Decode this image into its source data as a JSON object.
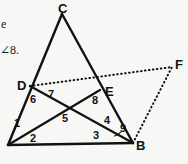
{
  "figure": {
    "type": "geometry-diagram",
    "width": 188,
    "height": 164,
    "background_color": "#f7f7f5",
    "stroke_color": "#111111",
    "caption_fragment_left": "e",
    "caption_fragment_angle": "∠8.",
    "vertices": [
      {
        "id": "A",
        "label": "",
        "x": 8,
        "y": 145
      },
      {
        "id": "B",
        "label": "B",
        "x": 133,
        "y": 143
      },
      {
        "id": "C",
        "label": "C",
        "x": 62,
        "y": 14
      },
      {
        "id": "D",
        "label": "D",
        "x": 30,
        "y": 86
      },
      {
        "id": "E",
        "label": "E",
        "x": 100,
        "y": 90
      },
      {
        "id": "F",
        "label": "F",
        "x": 172,
        "y": 67
      }
    ],
    "vertex_labels": [
      {
        "name": "vertex-label-c",
        "text": "C",
        "x": 58,
        "y": 2
      },
      {
        "name": "vertex-label-d",
        "text": "D",
        "x": 17,
        "y": 79
      },
      {
        "name": "vertex-label-e",
        "text": "E",
        "x": 105,
        "y": 85
      },
      {
        "name": "vertex-label-f",
        "text": "F",
        "x": 175,
        "y": 58
      },
      {
        "name": "vertex-label-b",
        "text": "B",
        "x": 136,
        "y": 139
      }
    ],
    "angle_labels": [
      {
        "name": "angle-label-1",
        "text": "1",
        "x": 14,
        "y": 118
      },
      {
        "name": "angle-label-2",
        "text": "2",
        "x": 30,
        "y": 133
      },
      {
        "name": "angle-label-3",
        "text": "3",
        "x": 93,
        "y": 130
      },
      {
        "name": "angle-label-4",
        "text": "4",
        "x": 104,
        "y": 115
      },
      {
        "name": "angle-label-5",
        "text": "5",
        "x": 62,
        "y": 113
      },
      {
        "name": "angle-label-6",
        "text": "6",
        "x": 30,
        "y": 94
      },
      {
        "name": "angle-label-7",
        "text": "7",
        "x": 48,
        "y": 89
      },
      {
        "name": "angle-label-8",
        "text": "8",
        "x": 92,
        "y": 95
      },
      {
        "name": "angle-label-9",
        "text": "9",
        "x": 120,
        "y": 123
      }
    ],
    "solid_segments": [
      {
        "name": "segment-a-c",
        "from": "A",
        "to": "C",
        "width": 2.4
      },
      {
        "name": "segment-c-b",
        "from": "C",
        "to": "B",
        "width": 2.4
      },
      {
        "name": "segment-a-b",
        "from": "A",
        "to": "B",
        "width": 2.6
      },
      {
        "name": "segment-d-b",
        "from": "D",
        "to": "B",
        "width": 2.2
      },
      {
        "name": "segment-e-a",
        "from": "E",
        "to": "A",
        "width": 2.2
      }
    ],
    "dotted_segments": [
      {
        "name": "segment-d-f-dotted",
        "from": "D",
        "to": "F",
        "width": 2.0
      },
      {
        "name": "segment-b-f-dotted",
        "from": "B",
        "to": "F",
        "width": 2.0
      }
    ],
    "arcs": [
      {
        "name": "angle-arc-9",
        "cx": 133,
        "cy": 143,
        "r": 20,
        "start_deg": 200,
        "end_deg": 235
      }
    ]
  }
}
